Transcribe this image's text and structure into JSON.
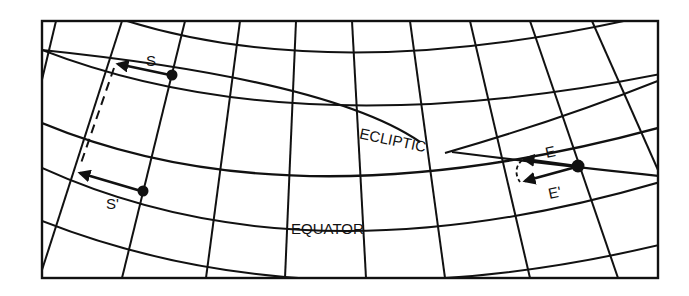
{
  "diagram": {
    "type": "celestial-grid-precession",
    "colors": {
      "ink": "#111111",
      "paper": "#ffffff"
    },
    "frame": {
      "x": 42,
      "y": 21,
      "width": 616,
      "height": 257
    },
    "labels": {
      "ecliptic": "ECLIPTIC",
      "equator": "EQUATOR",
      "s": "S",
      "s_prime": "S'",
      "e": "E",
      "e_prime": "E'"
    },
    "points": {
      "S": {
        "x": 172,
        "y": 75
      },
      "S_prime": {
        "x": 143,
        "y": 191
      },
      "E": {
        "x": 578,
        "y": 166
      }
    }
  }
}
